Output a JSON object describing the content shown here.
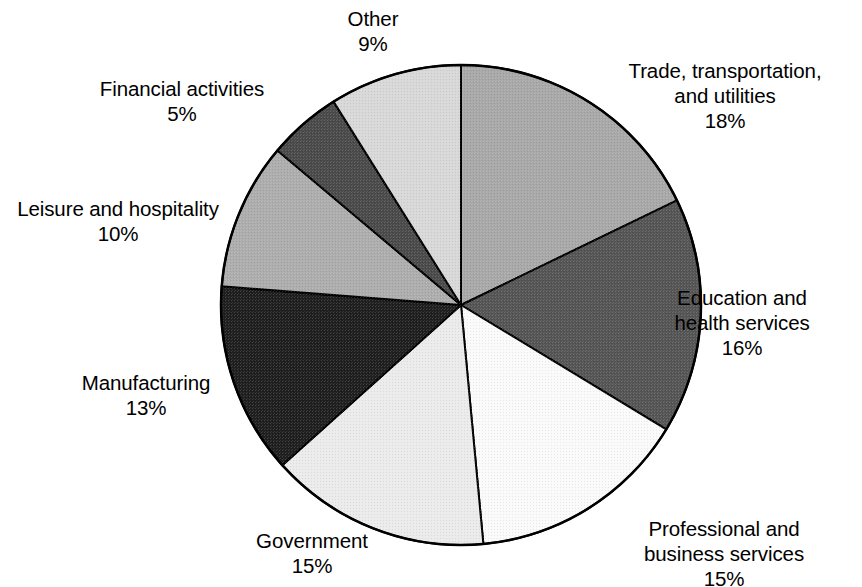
{
  "chart_data": {
    "type": "pie",
    "title": "",
    "subtitle": "",
    "xlabel": "",
    "ylabel": "",
    "legend_position": "none",
    "grid": false,
    "units": "percent",
    "value_suffix": "%",
    "start_angle_deg": 0,
    "direction": "clockwise",
    "total": 101,
    "categories": [
      "Trade, transportation, and utilities",
      "Education and health services",
      "Professional and business services",
      "Government",
      "Manufacturing",
      "Leisure and hospitality",
      "Financial activities",
      "Other"
    ],
    "values": [
      18,
      16,
      15,
      15,
      13,
      10,
      5,
      9
    ],
    "slices": [
      {
        "id": "trade",
        "name_line1": "Trade, transportation,",
        "name_line2": "and utilities",
        "value_text": "18%",
        "value": 18,
        "color": "#a8a8a8",
        "align": "center"
      },
      {
        "id": "education",
        "name_line1": "Education and",
        "name_line2": "health services",
        "value_text": "16%",
        "value": 16,
        "color": "#555555",
        "align": "center"
      },
      {
        "id": "professional",
        "name_line1": "Professional and",
        "name_line2": "business services",
        "value_text": "15%",
        "value": 15,
        "color": "#fafafa",
        "align": "center"
      },
      {
        "id": "government",
        "name_line1": "Government",
        "name_line2": "",
        "value_text": "15%",
        "value": 15,
        "color": "#ebebeb",
        "align": "center"
      },
      {
        "id": "manufacturing",
        "name_line1": "Manufacturing",
        "name_line2": "",
        "value_text": "13%",
        "value": 13,
        "color": "#1f1f1f",
        "align": "center"
      },
      {
        "id": "leisure",
        "name_line1": "Leisure and hospitality",
        "name_line2": "",
        "value_text": "10%",
        "value": 10,
        "color": "#adadad",
        "align": "center"
      },
      {
        "id": "financial",
        "name_line1": "Financial activities",
        "name_line2": "",
        "value_text": "5%",
        "value": 5,
        "color": "#4a4a4a",
        "align": "center"
      },
      {
        "id": "other",
        "name_line1": "Other",
        "name_line2": "",
        "value_text": "9%",
        "value": 9,
        "color": "#d8d8d8",
        "align": "center"
      }
    ],
    "geometry": {
      "center_x": 461,
      "center_y": 305,
      "radius": 240,
      "outline_color": "#000000",
      "outline_width": 2.5
    }
  }
}
